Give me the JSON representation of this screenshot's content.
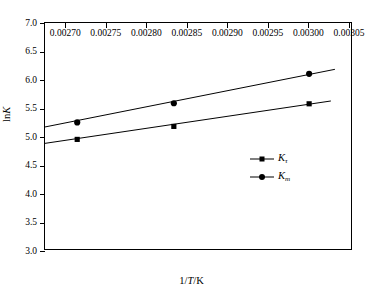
{
  "chart_data": {
    "type": "scatter",
    "title": "",
    "xlabel": "1/T/K",
    "ylabel": "lnK",
    "xlim": [
      0.002675,
      0.003055
    ],
    "ylim": [
      3.0,
      7.0
    ],
    "grid": false,
    "legend_position": "center-right",
    "xticks": [
      0.0027,
      0.00275,
      0.0028,
      0.00285,
      0.0029,
      0.00295,
      0.003,
      0.00305
    ],
    "xtick_labels": [
      "0.00270",
      "0.00275",
      "0.00280",
      "0.00285",
      "0.00290",
      "0.00295",
      "0.00300",
      "0.00305"
    ],
    "yticks": [
      3.0,
      3.5,
      4.0,
      4.5,
      5.0,
      5.5,
      6.0,
      6.5,
      7.0
    ],
    "ytick_labels": [
      "3.0",
      "3.5",
      "4.0",
      "4.5",
      "5.0",
      "5.5",
      "6.0",
      "6.5",
      "7.0"
    ],
    "x": [
      0.002715,
      0.002835,
      0.003003
    ],
    "series": [
      {
        "name": "K_tau",
        "label_base": "K",
        "label_sub": "τ",
        "marker": "square",
        "values": [
          4.94,
          5.17,
          5.57
        ],
        "fit_line": {
          "x0": 0.002675,
          "y0": 4.87,
          "x1": 0.00303,
          "y1": 5.62
        }
      },
      {
        "name": "K_m",
        "label_base": "K",
        "label_sub": "m",
        "marker": "circle",
        "values": [
          5.24,
          5.58,
          6.1
        ],
        "fit_line": {
          "x0": 0.002675,
          "y0": 5.16,
          "x1": 0.003035,
          "y1": 6.18
        }
      }
    ]
  },
  "axes": {
    "x_title_prefix": "1/",
    "x_title_var": "T",
    "x_title_suffix": "/K",
    "y_title_prefix": "ln",
    "y_title_var": "K"
  },
  "legend": {
    "items": [
      {
        "base": "K",
        "sub": "τ",
        "marker": "square"
      },
      {
        "base": "K",
        "sub": "m",
        "marker": "circle"
      }
    ]
  }
}
